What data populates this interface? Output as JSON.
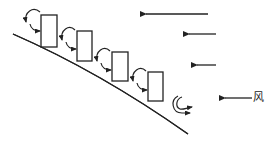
{
  "diagram": {
    "type": "wind-over-stepped-buildings-on-slope",
    "wind_label": "风",
    "colors": {
      "stroke": "#222222",
      "background": "#ffffff"
    },
    "buildings": [
      {
        "id": 1,
        "x": 41,
        "y": 15,
        "w": 16,
        "h": 32
      },
      {
        "id": 2,
        "x": 77,
        "y": 31,
        "w": 15,
        "h": 30
      },
      {
        "id": 3,
        "x": 112,
        "y": 52,
        "w": 16,
        "h": 29
      },
      {
        "id": 4,
        "x": 148,
        "y": 72,
        "w": 15,
        "h": 29
      }
    ],
    "wind_arrows": [
      {
        "x1": 208,
        "y1": 14,
        "x2": 140
      },
      {
        "x1": 216,
        "y1": 34,
        "x2": 183
      },
      {
        "x1": 216,
        "y1": 65,
        "x2": 191
      },
      {
        "x1": 252,
        "y1": 98,
        "x2": 219
      }
    ],
    "eddies": [
      {
        "cx": 31,
        "cy": 18,
        "target": "building-1"
      },
      {
        "cx": 67,
        "cy": 36,
        "target": "building-2"
      },
      {
        "cx": 102,
        "cy": 58,
        "target": "building-3"
      },
      {
        "cx": 138,
        "cy": 79,
        "target": "building-4"
      },
      {
        "cx": 184,
        "cy": 103,
        "target": "free"
      }
    ]
  }
}
